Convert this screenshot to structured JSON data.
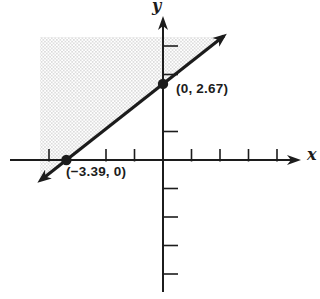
{
  "chart_data": {
    "type": "line",
    "title": "",
    "xlabel": "x",
    "ylabel": "y",
    "grid": false,
    "axis_range": {
      "x": [
        -5.3,
        4.8
      ],
      "y": [
        -4.9,
        5.0
      ]
    },
    "x_ticks": [
      -4,
      -2,
      -1,
      1,
      2,
      3,
      4
    ],
    "y_ticks": [
      4,
      3,
      1,
      -1,
      -2,
      -3,
      -4
    ],
    "line": {
      "points": [
        [
          -3.39,
          0
        ],
        [
          0,
          2.67
        ]
      ],
      "x_intercept": -3.39,
      "y_intercept": 2.67,
      "slope": 0.7876,
      "arrowheads": "both-ends"
    },
    "points": [
      {
        "x": -3.39,
        "y": 0,
        "label": "(−3.39, 0)"
      },
      {
        "x": 0,
        "y": 2.67,
        "label": "(0, 2.67)"
      }
    ],
    "shaded_region": "above-line",
    "shading_style": "stipple-dots"
  },
  "labels": {
    "x_axis": "x",
    "y_axis": "y",
    "x_intercept_point": "(−3.39, 0)",
    "y_intercept_point": "(0, 2.67)"
  },
  "colors": {
    "ink": "#1c1c1c",
    "stipple": "#bdbdbd",
    "background": "#ffffff"
  }
}
